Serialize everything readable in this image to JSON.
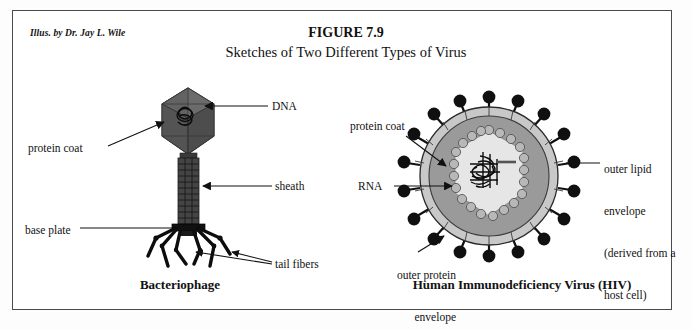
{
  "figure": {
    "attribution": "Illus. by Dr. Jay L. Wile",
    "number": "FIGURE 7.9",
    "subtitle": "Sketches of Two Different Types of Virus"
  },
  "panels": {
    "left": {
      "caption": "Bacteriophage",
      "labels": {
        "dna": "DNA",
        "protein_coat": "protein coat",
        "sheath": "sheath",
        "base_plate": "base plate",
        "tail_fibers": "tail fibers"
      }
    },
    "right": {
      "caption": "Human Immunodeficiency Virus (HIV)",
      "labels": {
        "protein_coat": "protein coat",
        "rna": "RNA",
        "outer_lipid_line1": "outer lipid",
        "outer_lipid_line2": "envelope",
        "outer_lipid_line3": "(derived from a",
        "outer_lipid_line4": "host cell)",
        "outer_protein_line1": "outer protein",
        "outer_protein_line2": "envelope"
      }
    }
  },
  "colors": {
    "ink": "#111111",
    "frame": "#4a4a4a",
    "head_dark": "#595959",
    "head_facet": "#6e6e6e",
    "sheath_dark": "#3d3d3d",
    "fiber_black": "#0d0d0d",
    "hiv_body": "#9a9a9a",
    "hiv_rim": "#c8c8c8",
    "hiv_core_fill": "#e2e2e2",
    "hiv_bead": "#b5b5b5",
    "spike_black": "#101010"
  }
}
